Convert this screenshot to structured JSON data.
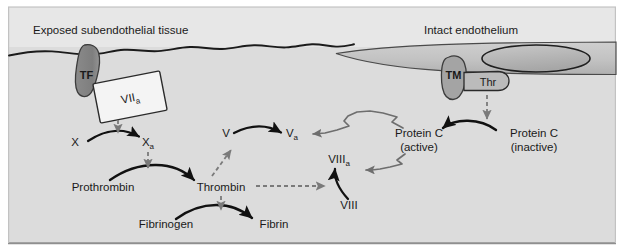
{
  "figure": {
    "background_color": "#dcdcdc",
    "upper_band_color": "#e9e9e9",
    "frame_border_color": "#9a9a9a"
  },
  "regions": {
    "left_label": "Exposed subendothelial tissue",
    "right_label": "Intact endothelium",
    "endothelium_fill": "#c0c0c0",
    "nucleus_fill": "#b4b4b4"
  },
  "membrane_proteins": [
    {
      "name": "tissue-factor",
      "label": "TF",
      "fill": "#8c8c8c",
      "text_color": "#1a1a1a"
    },
    {
      "name": "factor-viia",
      "label": "VII",
      "sub": "a",
      "fill": "#f2f2f2",
      "text_color": "#1a1a1a"
    },
    {
      "name": "thrombomodulin",
      "label": "TM",
      "fill": "#a8a8a8",
      "text_color": "#1a1a1a"
    },
    {
      "name": "thrombin-bound",
      "label": "Thr",
      "fill": "#b8b8b8",
      "text_color": "#1a1a1a"
    }
  ],
  "nodes": {
    "x": {
      "label": "X"
    },
    "xa": {
      "label": "X",
      "sub": "a"
    },
    "prothrombin": {
      "label": "Prothrombin"
    },
    "thrombin": {
      "label": "Thrombin"
    },
    "fibrinogen": {
      "label": "Fibrinogen"
    },
    "fibrin": {
      "label": "Fibrin"
    },
    "v": {
      "label": "V"
    },
    "va": {
      "label": "V",
      "sub": "a"
    },
    "viii": {
      "label": "VIII"
    },
    "viiia": {
      "label": "VIII",
      "sub": "a"
    },
    "protein_c_active_line1": {
      "label": "Protein C"
    },
    "protein_c_active_line2": {
      "label": "(active)"
    },
    "protein_c_inactive_line1": {
      "label": "Protein C"
    },
    "protein_c_inactive_line2": {
      "label": "(inactive)"
    }
  },
  "arrows": {
    "conversion_color": "#111111",
    "catalysis_color": "#7a7a7a",
    "inhibition_color": "#6e6e6e",
    "legend": {
      "conversion": "solid black curved arrow (conversion)",
      "catalysis": "gray dashed arrow (catalysis / activation)",
      "inhibition": "gray jagged arrow (inactivation)"
    }
  }
}
